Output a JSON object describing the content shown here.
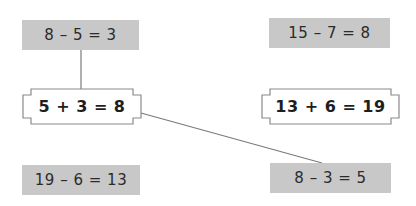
{
  "colors": {
    "subtraction_box_fill": "#c8c8c8",
    "addition_box_stroke": "#8a8a8a",
    "connector_line": "#7a7a7a",
    "text": "#2b2b2b"
  },
  "subtraction_facts": [
    {
      "id": "s1",
      "text": "8 – 5 = 3"
    },
    {
      "id": "s2",
      "text": "15 – 7 = 8"
    },
    {
      "id": "s3",
      "text": "19 – 6 = 13"
    },
    {
      "id": "s4",
      "text": "8 – 3 = 5"
    }
  ],
  "addition_facts": [
    {
      "id": "a1",
      "text": "5 + 3 = 8"
    },
    {
      "id": "a2",
      "text": "13 + 6 = 19"
    }
  ],
  "connections": [
    {
      "from": "s1",
      "to": "a1"
    },
    {
      "from": "a1",
      "to": "s4"
    }
  ]
}
